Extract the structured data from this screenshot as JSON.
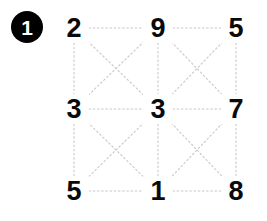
{
  "badge": {
    "label": "1",
    "shape": "filled-circle",
    "background_color": "#000000",
    "text_color": "#ffffff"
  },
  "grid": {
    "rows": 3,
    "cols": 3,
    "digit_color": "#0a0a0a",
    "link_color": "#c8c8c8",
    "link_style": "dotted",
    "nodes": [
      {
        "id": "r0c0",
        "value": "2",
        "x": 74,
        "y": 28
      },
      {
        "id": "r0c1",
        "value": "9",
        "x": 158,
        "y": 28
      },
      {
        "id": "r0c2",
        "value": "5",
        "x": 236,
        "y": 28
      },
      {
        "id": "r1c0",
        "value": "3",
        "x": 74,
        "y": 109
      },
      {
        "id": "r1c1",
        "value": "3",
        "x": 158,
        "y": 109
      },
      {
        "id": "r1c2",
        "value": "7",
        "x": 236,
        "y": 109
      },
      {
        "id": "r2c0",
        "value": "5",
        "x": 74,
        "y": 191
      },
      {
        "id": "r2c1",
        "value": "1",
        "x": 158,
        "y": 191
      },
      {
        "id": "r2c2",
        "value": "8",
        "x": 236,
        "y": 191
      }
    ],
    "edges": [
      {
        "from": "r0c0",
        "to": "r0c1"
      },
      {
        "from": "r0c1",
        "to": "r0c2"
      },
      {
        "from": "r1c0",
        "to": "r1c1"
      },
      {
        "from": "r1c1",
        "to": "r1c2"
      },
      {
        "from": "r2c0",
        "to": "r2c1"
      },
      {
        "from": "r2c1",
        "to": "r2c2"
      },
      {
        "from": "r0c0",
        "to": "r1c0"
      },
      {
        "from": "r1c0",
        "to": "r2c0"
      },
      {
        "from": "r0c1",
        "to": "r1c1"
      },
      {
        "from": "r1c1",
        "to": "r2c1"
      },
      {
        "from": "r0c2",
        "to": "r1c2"
      },
      {
        "from": "r1c2",
        "to": "r2c2"
      },
      {
        "from": "r0c0",
        "to": "r1c1"
      },
      {
        "from": "r0c1",
        "to": "r1c0"
      },
      {
        "from": "r0c1",
        "to": "r1c2"
      },
      {
        "from": "r0c2",
        "to": "r1c1"
      },
      {
        "from": "r1c0",
        "to": "r2c1"
      },
      {
        "from": "r1c1",
        "to": "r2c0"
      },
      {
        "from": "r1c1",
        "to": "r2c2"
      },
      {
        "from": "r1c2",
        "to": "r2c1"
      }
    ]
  }
}
